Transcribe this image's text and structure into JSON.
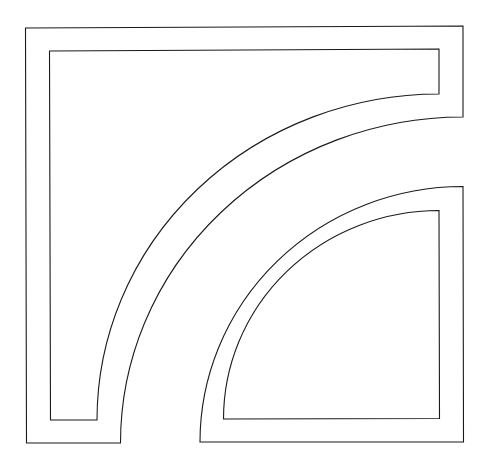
{
  "diagram": {
    "background": "#ffffff",
    "stroke_color": "#1a1a1a",
    "stroke_width": 1.1,
    "shapes": [
      {
        "name": "left-curved-band-outer",
        "d": "M 25.5 28 L 463 26 L 463 117 A 342.5 326 0 0 0 120.5 443 L 26.5 443 Z"
      },
      {
        "name": "left-curved-band-inner",
        "d": "M 49.5 51 L 439 49 L 439 94 A 342 326 0 0 0 97 420 L 50.5 420 Z"
      },
      {
        "name": "right-quarter-band-outer",
        "d": "M 463 186.5 L 463.5 442 L 200 442 A 263 255.5 0 0 1 463 186.5 Z"
      },
      {
        "name": "right-quarter-band-inner",
        "d": "M 439 210.5 L 439.5 418.5 L 223.5 419 A 215.5 208.5 0 0 1 439 210.5 Z"
      }
    ]
  }
}
